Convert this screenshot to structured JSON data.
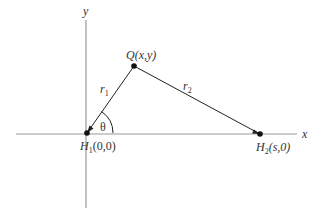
{
  "diagram": {
    "axes": {
      "x_label": "x",
      "y_label": "y",
      "color": "#9a9a9a"
    },
    "points": {
      "H1": {
        "label_main": "H",
        "label_sub": "1",
        "label_coords": "(0,0)",
        "x": 87,
        "y": 133
      },
      "H2": {
        "label_main": "H",
        "label_sub": "2",
        "label_coords": "(s,0)",
        "x": 260,
        "y": 134
      },
      "Q": {
        "label_main": "Q",
        "label_coords": "(x,y)",
        "x": 134,
        "y": 66
      }
    },
    "segments": {
      "r1": {
        "label_main": "r",
        "label_sub": "1"
      },
      "r2": {
        "label_main": "r",
        "label_sub": "2"
      }
    },
    "angle": {
      "label": "θ"
    },
    "line_color": "#222222"
  }
}
